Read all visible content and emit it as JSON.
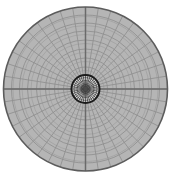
{
  "figure": {
    "background_color": "#ffffff",
    "width": 171,
    "height": 180
  },
  "chart_data": {
    "type": "scatter",
    "subtitle": "",
    "xlabel": "",
    "ylabel": "",
    "grid": true,
    "legend_position": "none",
    "projection": "polar",
    "center": {
      "x": 85.5,
      "y": 89.0
    },
    "outer_radius": 82.0,
    "hub_radius": 14.0,
    "angular_sectors": 40,
    "radial_rings": 9,
    "hub_spokes": 36,
    "axis_lines": [
      "vertical",
      "horizontal"
    ],
    "ring_radii": [
      14,
      22,
      31,
      40,
      49,
      58,
      66,
      74,
      82
    ],
    "tick_labels": [],
    "annotations": [],
    "colors": {
      "cell_fill": "#b5b5b5",
      "grid_line": "#8f8f8f",
      "axis_line": "#6a6a6a",
      "outer_rim": "#5c5c5c",
      "hub_ring": "#1a1a1a",
      "hub_fill": "#d8d8d8",
      "hub_spoke": "#2b2b2b",
      "hub_core": "#4a4a4a",
      "background": "#ffffff"
    }
  },
  "labels": {
    "figure_caption": "",
    "center_label": "",
    "units": ""
  }
}
